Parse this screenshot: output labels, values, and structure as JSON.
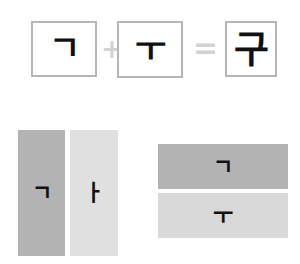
{
  "equation": {
    "terms": [
      {
        "id": "consonant",
        "glyph": "ㄱ",
        "name": "giyeok-consonant"
      },
      {
        "id": "vowel",
        "glyph": "ㅜ",
        "name": "u-vowel"
      },
      {
        "id": "syllable",
        "glyph": "구",
        "name": "gu-syllable"
      }
    ],
    "operators": {
      "plus": "+",
      "equals": "="
    }
  },
  "diagrams": {
    "vertical": {
      "label": "left-right-composition",
      "initial": {
        "glyph": "ㄱ",
        "color": "#b3b3b3"
      },
      "medial": {
        "glyph": "ㅏ",
        "color": "#e0e0e0"
      }
    },
    "horizontal": {
      "label": "top-bottom-composition",
      "initial": {
        "glyph": "ㄱ",
        "color": "#b3b3b3"
      },
      "medial": {
        "glyph": "ㅜ",
        "color": "#d9d9d9"
      }
    }
  },
  "colors": {
    "box_border": "#b6b6b6",
    "glyph": "#111111",
    "operator": "#d2d2d2",
    "background": "#ffffff"
  }
}
